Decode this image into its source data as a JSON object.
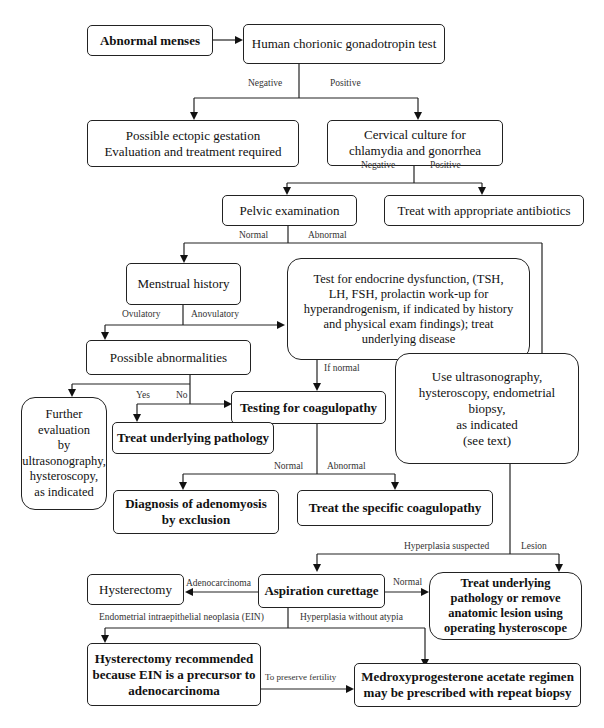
{
  "nodes": {
    "abnormal_menses": "Abnormal menses",
    "hcg_test": "Human chorionic gonadotropin test",
    "ectopic": "Possible ectopic gestation\nEvaluation and treatment required",
    "cervical_culture": "Cervical culture for\nchlamydia and gonorrhea",
    "pelvic_exam": "Pelvic examination",
    "antibiotics": "Treat with appropriate antibiotics",
    "menstrual_history": "Menstrual history",
    "endocrine_test": "Test for endocrine dysfunction, (TSH,\nLH, FSH, prolactin work-up for\nhyperandrogenism, if indicated by history\nand physical exam findings); treat\nunderlying disease",
    "possible_abnormalities": "Possible abnormalities",
    "further_evaluation": "Further\nevaluation\nby\nultrasonography,\nhysteroscopy,\nas indicated",
    "testing_coagulopathy": "Testing for coagulopathy",
    "use_ultrasonography": "Use ultrasonography,\nhysteroscopy, endometrial biopsy,\nas indicated\n(see text)",
    "treat_underlying_pathology": "Treat underlying pathology",
    "adenomyosis": "Diagnosis of adenomyosis\nby exclusion",
    "treat_coagulopathy": "Treat the specific coagulopathy",
    "hysterectomy": "Hysterectomy",
    "aspiration_curettage": "Aspiration curettage",
    "treat_remove_lesion": "Treat underlying\npathology or remove\nanatomic lesion using\noperating hysteroscope",
    "hysterectomy_recommended": "Hysterectomy recommended\nbecause EIN is a precursor to\nadenocarcinoma",
    "medroxyprogesterone": "Medroxyprogesterone acetate regimen\nmay be prescribed with repeat biopsy"
  },
  "edge_labels": {
    "hcg_negative": "Negative",
    "hcg_positive": "Positive",
    "culture_negative": "Negative",
    "culture_positive": "Positive",
    "pelvic_normal": "Normal",
    "pelvic_abnormal": "Abnormal",
    "ovulatory": "Ovulatory",
    "anovulatory": "Anovulatory",
    "if_normal": "If normal",
    "yes": "Yes",
    "no": "No",
    "coag_normal": "Normal",
    "coag_abnormal": "Abnormal",
    "hyperplasia_suspected": "Hyperplasia suspected",
    "lesion": "Lesion",
    "adenocarcinoma": "Adenocarcinoma",
    "curettage_normal": "Normal",
    "ein": "Endometrial intraepithelial neoplasia (EIN)",
    "hyperplasia_without_atypia": "Hyperplasia without atypia",
    "preserve_fertility": "To preserve fertility"
  }
}
